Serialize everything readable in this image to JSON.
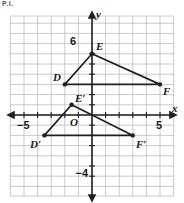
{
  "page": {
    "top_fragment": "P.I.",
    "background": "#ffffff"
  },
  "figure": {
    "kind": "coordinate-plane-dilation",
    "axis_labels": {
      "x": "x",
      "y": "y"
    },
    "origin_label": "O",
    "tick_labels": [
      {
        "name": "x-neg-5",
        "text": "−5",
        "x": -5,
        "y": 0
      },
      {
        "name": "x-pos-5",
        "text": "5",
        "x": 5,
        "y": 0
      },
      {
        "name": "y-pos-6",
        "text": "6",
        "x": 0,
        "y": 6
      },
      {
        "name": "y-neg-4",
        "text": "−4",
        "x": 0,
        "y": -4
      }
    ],
    "grid": {
      "xmin": -6,
      "xmax": 5.5,
      "ymin": -5.5,
      "ymax": 7,
      "step": 1,
      "show": true,
      "grid_color": "#b9bcc6",
      "axis_color": "#231f20"
    },
    "colors": {
      "shape_stroke": "#231f20",
      "vertex_fill": "#231f20",
      "grid": "#b9bcc6"
    },
    "shapes": [
      {
        "name": "triangle-DEF",
        "label": "DEF",
        "vertices": [
          {
            "label": "D",
            "x": -2,
            "y": 3
          },
          {
            "label": "E",
            "x": 0,
            "y": 6
          },
          {
            "label": "F",
            "x": 5,
            "y": 3
          }
        ]
      },
      {
        "name": "triangle-D-prime-E-prime-F-prime",
        "label": "D′E′F′",
        "vertices": [
          {
            "label": "D′",
            "x": -3.5,
            "y": -2
          },
          {
            "label": "E′",
            "x": -1.5,
            "y": 1
          },
          {
            "label": "F′",
            "x": 3,
            "y": -2
          }
        ]
      }
    ]
  }
}
